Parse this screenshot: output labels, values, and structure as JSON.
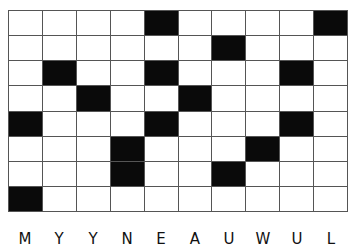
{
  "puzzle": {
    "type": "crossword-grid",
    "rows": 8,
    "cols": 10,
    "colors": {
      "filled": "#0a0a0a",
      "empty": "#ffffff",
      "gridline": "#555555"
    },
    "black_cells": [
      [
        0,
        4
      ],
      [
        0,
        9
      ],
      [
        1,
        6
      ],
      [
        2,
        1
      ],
      [
        2,
        4
      ],
      [
        2,
        8
      ],
      [
        3,
        2
      ],
      [
        3,
        5
      ],
      [
        4,
        0
      ],
      [
        4,
        4
      ],
      [
        4,
        8
      ],
      [
        5,
        3
      ],
      [
        5,
        7
      ],
      [
        6,
        3
      ],
      [
        6,
        6
      ],
      [
        7,
        0
      ]
    ]
  },
  "column_labels": [
    "M",
    "Y",
    "Y",
    "N",
    "E",
    "A",
    "U",
    "W",
    "U",
    "L"
  ]
}
